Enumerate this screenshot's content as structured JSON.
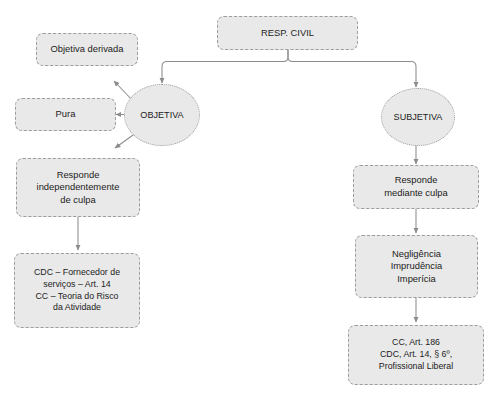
{
  "diagram": {
    "background_color": "#ffffff",
    "node_fill_color": "#e9e9e9",
    "node_border_color": "#9c9c9c",
    "edge_color": "#8c8c8c",
    "text_color": "#1c1c1c",
    "nodes": [
      {
        "id": "resp_civil",
        "shape": "box",
        "lines": [
          "RESP. CIVIL"
        ]
      },
      {
        "id": "objetiva",
        "shape": "ellipse",
        "lines": [
          "OBJETIVA"
        ]
      },
      {
        "id": "subjetiva",
        "shape": "ellipse",
        "lines": [
          "SUBJETIVA"
        ]
      },
      {
        "id": "objetiva_derivada",
        "shape": "box",
        "lines": [
          "Objetiva derivada"
        ]
      },
      {
        "id": "pura",
        "shape": "box",
        "lines": [
          "Pura"
        ]
      },
      {
        "id": "responde_independentemente",
        "shape": "box",
        "lines": [
          "Responde",
          "independentemente",
          "de culpa"
        ]
      },
      {
        "id": "cdc_cc_objetiva",
        "shape": "box",
        "lines": [
          "CDC – Fornecedor de",
          "serviços – Art. 14",
          "CC – Teoria do Risco",
          "da Atividade"
        ]
      },
      {
        "id": "responde_mediante_culpa",
        "shape": "box",
        "lines": [
          "Responde",
          "mediante culpa"
        ]
      },
      {
        "id": "culpa_modalidades",
        "shape": "box",
        "lines": [
          "Negligência",
          "Imprudência",
          "Imperícia"
        ]
      },
      {
        "id": "cc_cdc_subjetiva",
        "shape": "box",
        "lines": [
          "CC, Art. 186",
          "CDC, Art. 14, § 6º,",
          "Profissional Liberal"
        ]
      }
    ],
    "edges": [
      {
        "from": "resp_civil",
        "to": "objetiva",
        "style": "orthogonal-arrow"
      },
      {
        "from": "resp_civil",
        "to": "subjetiva",
        "style": "orthogonal-arrow"
      },
      {
        "from": "objetiva",
        "to": "objetiva_derivada",
        "style": "diagonal-arrow"
      },
      {
        "from": "objetiva",
        "to": "pura",
        "style": "straight-arrow"
      },
      {
        "from": "objetiva",
        "to": "responde_independentemente",
        "style": "diagonal-arrow"
      },
      {
        "from": "responde_independentemente",
        "to": "cdc_cc_objetiva",
        "style": "vertical-arrow"
      },
      {
        "from": "subjetiva",
        "to": "responde_mediante_culpa",
        "style": "vertical-arrow"
      },
      {
        "from": "responde_mediante_culpa",
        "to": "culpa_modalidades",
        "style": "vertical-arrow"
      },
      {
        "from": "culpa_modalidades",
        "to": "cc_cdc_subjetiva",
        "style": "vertical-arrow"
      }
    ]
  }
}
